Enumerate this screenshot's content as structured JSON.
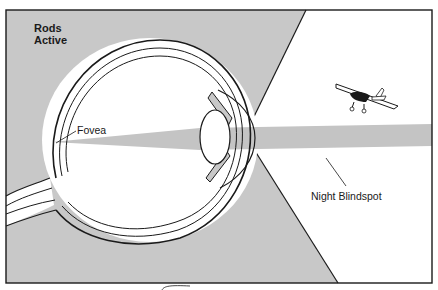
{
  "title_label": {
    "line1": "Rods",
    "line2": "Active"
  },
  "labels": {
    "fovea": "Fovea",
    "night_blindspot": "Night Blindspot"
  },
  "colors": {
    "gray_field": "#c8c8c8",
    "blindspot_band": "#c4c4c4",
    "outline": "#1a1a1a",
    "background": "#ffffff"
  },
  "icons": {
    "eye": "eye-cross-section",
    "airplane": "small-airplane"
  }
}
